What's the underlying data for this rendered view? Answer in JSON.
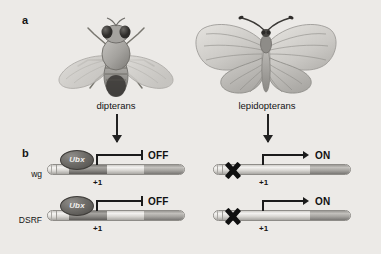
{
  "figure": {
    "background_color": "#eceae7",
    "panels": [
      {
        "id": "a",
        "label": "a"
      },
      {
        "id": "b",
        "label": "b"
      }
    ]
  },
  "panel_a": {
    "label": "a",
    "organisms": [
      {
        "id": "dipterans",
        "label": "dipterans",
        "icon": "fly-icon",
        "wing_pairs": 1
      },
      {
        "id": "lepidopterans",
        "label": "lepidopterans",
        "icon": "butterfly-icon",
        "wing_pairs": 2
      }
    ]
  },
  "panel_b": {
    "label": "b",
    "columns": [
      {
        "id": "dipterans",
        "ubx_bound": true,
        "state": "OFF"
      },
      {
        "id": "lepidopterans",
        "ubx_bound": false,
        "state": "ON"
      }
    ],
    "genes": [
      {
        "id": "wg",
        "label": "wg"
      },
      {
        "id": "dsrf",
        "label": "DSRF"
      }
    ],
    "protein": {
      "name": "Ubx",
      "label": "Ubx",
      "style": "italic",
      "color": "#5a5854"
    },
    "tss_label": "+1",
    "states": {
      "off": {
        "label": "OFF",
        "symbol": "repression-bar"
      },
      "on": {
        "label": "ON",
        "symbol": "activation-arrow"
      }
    },
    "no_binding_marker": {
      "symbol": "x-mark",
      "color": "#101010"
    },
    "constructs": [
      {
        "gene": "wg",
        "column": "dipterans",
        "ubx_bound": true,
        "state": "OFF",
        "tss": "+1"
      },
      {
        "gene": "wg",
        "column": "lepidopterans",
        "ubx_bound": false,
        "state": "ON",
        "tss": "+1"
      },
      {
        "gene": "dsrf",
        "column": "dipterans",
        "ubx_bound": true,
        "state": "OFF",
        "tss": "+1"
      },
      {
        "gene": "dsrf",
        "column": "lepidopterans",
        "ubx_bound": false,
        "state": "ON",
        "tss": "+1"
      }
    ]
  },
  "connectors": [
    {
      "from": "dipterans",
      "to": "wg-dipterans",
      "direction": "down"
    },
    {
      "from": "lepidopterans",
      "to": "wg-lepidopterans",
      "direction": "down"
    }
  ]
}
